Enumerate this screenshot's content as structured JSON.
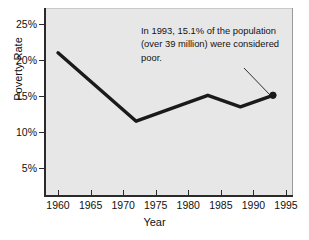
{
  "chart_data": {
    "type": "line",
    "title": "",
    "xlabel": "Year",
    "ylabel": "Poverty Rate",
    "xlim": [
      1959,
      1996
    ],
    "ylim": [
      0,
      26.5
    ],
    "grid": false,
    "legend": "none",
    "x_tick_labels": [
      "1960",
      "1965",
      "1970",
      "1975",
      "1980",
      "1985",
      "1990",
      "1995"
    ],
    "x_ticks": [
      1960,
      1965,
      1970,
      1975,
      1980,
      1985,
      1990,
      1995
    ],
    "y_tick_labels": [
      "25%",
      "20%",
      "15%",
      "10%",
      "5%"
    ],
    "y_ticks": [
      25,
      20,
      15,
      10,
      5
    ],
    "series": [
      {
        "name": "Poverty Rate",
        "color": "#1a1a1a",
        "line_width": 3.4,
        "x": [
          1960,
          1972,
          1983,
          1988,
          1993
        ],
        "values": [
          21.0,
          11.5,
          15.1,
          13.5,
          15.1
        ],
        "end_marker": {
          "x": 1993,
          "y": 15.1,
          "shape": "circle",
          "filled": true,
          "radius": 3.2
        }
      }
    ],
    "annotations": [
      {
        "name": "callout-1993",
        "lines": [
          "In 1993, 15.1% of the population",
          "(over 39 million) were considered",
          "poor."
        ],
        "leader_line": {
          "from": [
            244,
            68
          ],
          "to": [
            271.5,
            96.5
          ]
        }
      }
    ],
    "plot_background": "#e7e7e7",
    "figure_background": "#ffffff",
    "axis_color": "#2b2b2b"
  }
}
